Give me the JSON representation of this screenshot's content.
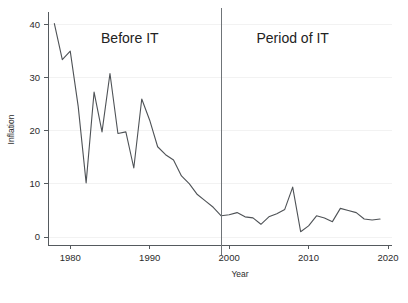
{
  "chart_data": {
    "type": "line",
    "title": "",
    "subtitle": "",
    "xlabel": "Year",
    "ylabel": "Inflation",
    "xlim": [
      1977.2,
      2020.5
    ],
    "ylim": [
      -1.5,
      42
    ],
    "grid": false,
    "legend": null,
    "x_ticks": [
      1980,
      1990,
      2000,
      2010,
      2020
    ],
    "x_tick_labels": [
      "1980",
      "1990",
      "2000",
      "2010",
      "2020"
    ],
    "y_ticks": [
      0,
      10,
      20,
      30,
      40
    ],
    "y_tick_labels": [
      "0",
      "10",
      "20",
      "30",
      "40"
    ],
    "line_color": "#4e5256",
    "divider_color": "#6f7478",
    "annotations": [
      {
        "text": "Before IT",
        "x": 1987.5,
        "y": 36.5
      },
      {
        "text": "Period of IT",
        "x": 2008.0,
        "y": 36.5
      }
    ],
    "vertical_markers": [
      {
        "x": 1999.0,
        "label": "IT regime start"
      }
    ],
    "series": [
      {
        "name": "Inflation",
        "x": [
          1978,
          1979,
          1980,
          1981,
          1982,
          1983,
          1984,
          1985,
          1986,
          1987,
          1988,
          1989,
          1990,
          1991,
          1992,
          1993,
          1994,
          1995,
          1996,
          1997,
          1998,
          1999,
          2000,
          2001,
          2002,
          2003,
          2004,
          2005,
          2006,
          2007,
          2008,
          2009,
          2010,
          2011,
          2012,
          2013,
          2014,
          2015,
          2016,
          2017,
          2018,
          2019
        ],
        "values": [
          40.2,
          33.4,
          35.0,
          24.6,
          10.2,
          27.3,
          19.8,
          30.8,
          19.5,
          19.8,
          13.0,
          26.0,
          22.0,
          17.0,
          15.5,
          14.5,
          11.5,
          10.0,
          8.0,
          6.8,
          5.6,
          4.0,
          4.2,
          4.6,
          3.8,
          3.6,
          2.4,
          3.8,
          4.4,
          5.2,
          9.4,
          1.0,
          2.1,
          4.0,
          3.6,
          2.9,
          5.4,
          5.0,
          4.6,
          3.4,
          3.2,
          3.4
        ]
      }
    ]
  },
  "axis": {
    "y_title": "Inflation",
    "x_title": "Year"
  },
  "annotations": {
    "before_it": "Before IT",
    "period_of_it": "Period of IT"
  }
}
